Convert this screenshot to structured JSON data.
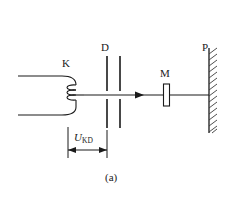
{
  "figure": {
    "caption": "(a)",
    "background_color": "#ffffff",
    "line_color": "#1a1a1a"
  },
  "labels": {
    "cathode": "K",
    "plates": "D",
    "target": "M",
    "screen": "P",
    "voltage_symbol": "U",
    "voltage_subscript": "KD"
  },
  "components": [
    {
      "id": "cathode-filament",
      "label": "K",
      "kind": "coiled-filament-cathode",
      "loops": 3,
      "lead_wires": 2
    },
    {
      "id": "aperture-plates",
      "label": "D",
      "kind": "parallel-plate-pair",
      "plates": 2
    },
    {
      "id": "target-crystal",
      "label": "M",
      "kind": "thin-rectangular-target"
    },
    {
      "id": "detector-wall",
      "label": "P",
      "kind": "hatched-wall-screen"
    }
  ],
  "beam": {
    "kind": "horizontal-ray-with-arrow",
    "direction": "right"
  },
  "dimension": {
    "id": "u-kd-dimension",
    "label_symbol": "U",
    "label_subscript": "KD",
    "style": "double-headed-arrow",
    "from_component": "K",
    "to_component": "D"
  }
}
